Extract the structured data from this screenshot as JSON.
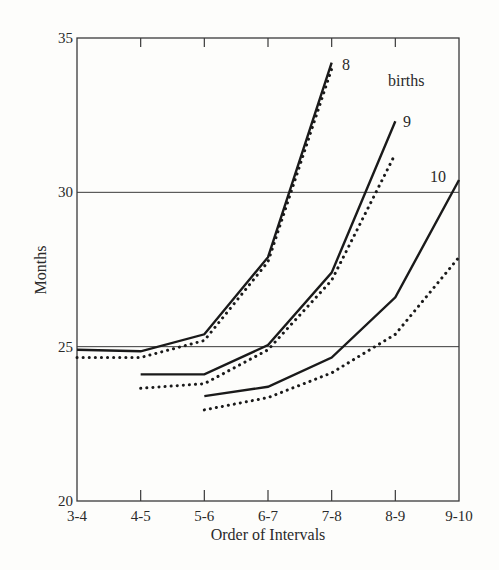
{
  "chart_data": {
    "type": "line",
    "title": "",
    "xlabel": "Order of Intervals",
    "ylabel": "Months",
    "categories": [
      "3-4",
      "4-5",
      "5-6",
      "6-7",
      "7-8",
      "8-9",
      "9-10"
    ],
    "ylim": [
      20,
      35
    ],
    "yticks": [
      20,
      25,
      30,
      35
    ],
    "grid": {
      "horizontal_lines_at": [
        25,
        30
      ]
    },
    "legend": null,
    "annotations": [
      {
        "text": "8",
        "near_series": "8 births (solid)"
      },
      {
        "text": "9",
        "near_series": "9 births (solid)"
      },
      {
        "text": "10",
        "near_series": "10 births (solid)"
      },
      {
        "text": "births",
        "position": "upper right"
      }
    ],
    "series": [
      {
        "name": "8 births (solid)",
        "style": "solid",
        "label": "8",
        "values": [
          24.9,
          24.85,
          25.4,
          27.9,
          34.2,
          null,
          null
        ]
      },
      {
        "name": "8 births (dotted)",
        "style": "dotted",
        "values": [
          24.65,
          24.65,
          25.2,
          27.75,
          34.0,
          null,
          null
        ]
      },
      {
        "name": "9 births (solid)",
        "style": "solid",
        "label": "9",
        "values": [
          null,
          24.1,
          24.1,
          25.05,
          27.4,
          32.3,
          null
        ]
      },
      {
        "name": "9 births (dotted)",
        "style": "dotted",
        "values": [
          null,
          23.65,
          23.8,
          24.9,
          27.15,
          31.25,
          null
        ]
      },
      {
        "name": "10 births (solid)",
        "style": "solid",
        "label": "10",
        "values": [
          null,
          null,
          23.4,
          23.7,
          24.65,
          26.6,
          30.4
        ]
      },
      {
        "name": "10 births (dotted)",
        "style": "dotted",
        "values": [
          null,
          null,
          22.95,
          23.35,
          24.15,
          25.4,
          27.9
        ]
      }
    ]
  },
  "labels": {
    "births": "births",
    "series_8": "8",
    "series_9": "9",
    "series_10": "10"
  },
  "colors": {
    "ink": "#1a1a1a",
    "frame": "#3a3a3a",
    "background": "#fdfdfb"
  }
}
